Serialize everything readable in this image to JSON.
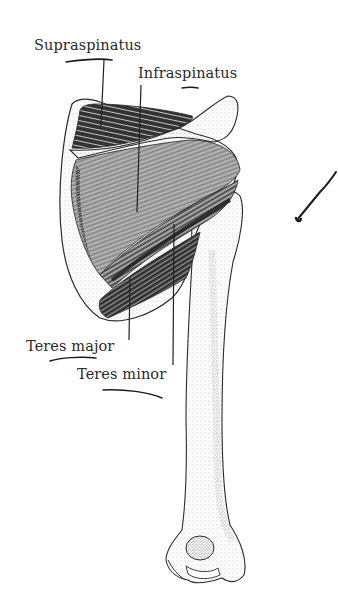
{
  "figure": {
    "labels": [
      {
        "id": "supraspinatus",
        "text": "Supraspinatus"
      },
      {
        "id": "infraspinatus",
        "text": "Infraspinatus"
      },
      {
        "id": "teres-major",
        "text": "Teres major"
      },
      {
        "id": "teres-minor",
        "text": "Teres minor"
      }
    ],
    "annotations": {
      "pen_color": "#1a1a1a",
      "ink_color": "#222222",
      "bone_stipple": "#8a8a8a"
    }
  }
}
